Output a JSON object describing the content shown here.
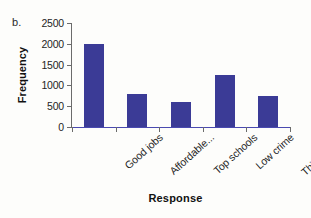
{
  "panel": {
    "label": "b."
  },
  "chart_data": {
    "type": "bar",
    "title": "",
    "categories": [
      "Good jobs",
      "Affordable...",
      "Top schools",
      "Low crime",
      "Things to do"
    ],
    "values": [
      2000,
      800,
      600,
      1250,
      750
    ],
    "series": [
      {
        "name": "Frequency",
        "values": [
          2000,
          800,
          600,
          1250,
          750
        ]
      }
    ],
    "xlabel": "Response",
    "ylabel": "Frequency",
    "ylim": [
      0,
      2500
    ],
    "ytick_labels": [
      "0",
      "500",
      "1000",
      "1500",
      "2000",
      "2500"
    ],
    "ytick_values": [
      0,
      500,
      1000,
      1500,
      2000,
      2500
    ],
    "ytick_interval": 500,
    "grid": false,
    "legend": false,
    "bar_color": "#3b3b96",
    "axis_color": "#4a4ab0",
    "background_color": "#fdfdfb",
    "xtick_label_rotation": -42
  }
}
